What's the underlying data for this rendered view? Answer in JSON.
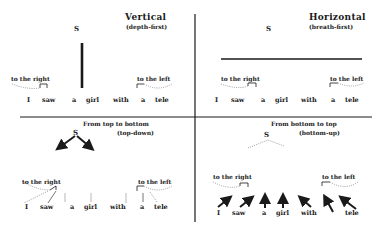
{
  "panels": {
    "vertical": {
      "title": "Vertical",
      "subtitle": "(depth-first)",
      "root": "S",
      "left_label": "to the right",
      "right_label": "to the left",
      "words": [
        "I",
        "saw",
        "a",
        "girl",
        "with",
        "a",
        "tele"
      ]
    },
    "horizontal": {
      "title": "Horizontal",
      "subtitle": "(breath-first)",
      "root": "S",
      "left_label": "to the right",
      "right_label": "to the left",
      "words": [
        "I",
        "saw",
        "a",
        "girl",
        "with",
        "a",
        "tele"
      ]
    },
    "topdown": {
      "title": "From top to bottom",
      "subtitle": "(top-down)",
      "root": "S",
      "left_label": "to the right",
      "right_label": "to the left",
      "words": [
        "I",
        "saw",
        "a",
        "girl",
        "with",
        "a",
        "tele"
      ]
    },
    "bottomup": {
      "title": "From bottom to top",
      "subtitle": "(bottom-up)",
      "root": "S",
      "left_label": "to the right",
      "right_label": "to the left",
      "words": [
        "I",
        "saw",
        "a",
        "girl",
        "with",
        "a",
        "tele"
      ]
    }
  },
  "colors": {
    "ink": "#1a1a1a",
    "dotted": "#777777",
    "background": "#ffffff"
  }
}
